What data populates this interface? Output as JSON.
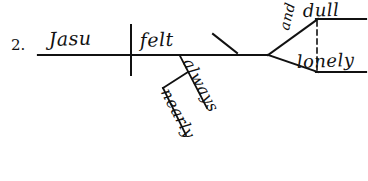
{
  "page": {
    "item_number": "2.",
    "ink_color": "#111111",
    "background_color": "#ffffff"
  },
  "diagram": {
    "type": "reed-kellogg-sentence-diagram",
    "subject": "Jasu",
    "verb": "felt",
    "conjunction": "and",
    "predicate_adjectives": [
      "dull",
      "lonely"
    ],
    "adverbs": [
      "always",
      "nearly"
    ]
  }
}
